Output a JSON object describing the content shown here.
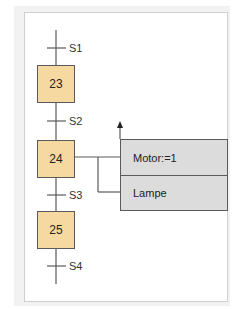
{
  "diagram": {
    "type": "GRAFCET / sequential function chart",
    "transitions": [
      {
        "id": "t1",
        "label": "S1"
      },
      {
        "id": "t2",
        "label": "S2"
      },
      {
        "id": "t3",
        "label": "S3"
      },
      {
        "id": "t4",
        "label": "S4"
      }
    ],
    "steps": [
      {
        "id": "s23",
        "label": "23"
      },
      {
        "id": "s24",
        "label": "24"
      },
      {
        "id": "s25",
        "label": "25"
      }
    ],
    "actions": [
      {
        "step": "24",
        "label": "Motor:=1"
      },
      {
        "step": "24",
        "label": "Lampe"
      }
    ],
    "colors": {
      "step_fill": "#f5d9a0",
      "action_fill": "#dcdcdc",
      "line": "#5a5a5a"
    }
  }
}
